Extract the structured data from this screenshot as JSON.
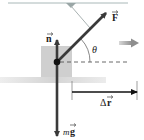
{
  "diagram": {
    "title": "",
    "labels": {
      "force": "F",
      "normal": "n",
      "weight": "mg",
      "weight_m": "m",
      "weight_g": "g",
      "angle": "θ",
      "displacement": "Δr",
      "displacement_delta": "Δ",
      "displacement_r": "r"
    },
    "vectors": [
      {
        "name": "applied-force",
        "label": "F",
        "direction": "up-right at angle θ above horizontal"
      },
      {
        "name": "normal-force",
        "label": "n",
        "direction": "up"
      },
      {
        "name": "weight",
        "label": "mg",
        "direction": "down"
      },
      {
        "name": "displacement",
        "label": "Δr",
        "direction": "right"
      }
    ],
    "colors": {
      "vector": "#3a3a3a",
      "block": "#c9c9c9",
      "ground": "#d6d6d6",
      "motion_arrow": "#9a9a9a",
      "ceiling_line": "#9fb0b0"
    }
  }
}
